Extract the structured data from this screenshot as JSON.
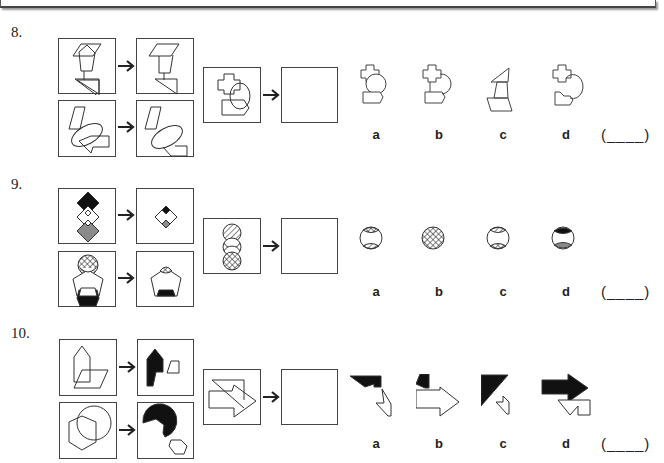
{
  "questions": [
    {
      "number": "8.",
      "options": [
        "a",
        "b",
        "c",
        "d"
      ],
      "answer_blank": "(____)"
    },
    {
      "number": "9.",
      "options": [
        "a",
        "b",
        "c",
        "d"
      ],
      "answer_blank": "(____)"
    },
    {
      "number": "10.",
      "options": [
        "a",
        "b",
        "c",
        "d"
      ],
      "answer_blank": "(____)"
    }
  ],
  "icons": {
    "arrow": "right-arrow",
    "answer_box": "empty-square"
  },
  "colors": {
    "stroke": "#333333",
    "fill_black": "#111111",
    "fill_gray": "#8a8a8a"
  }
}
